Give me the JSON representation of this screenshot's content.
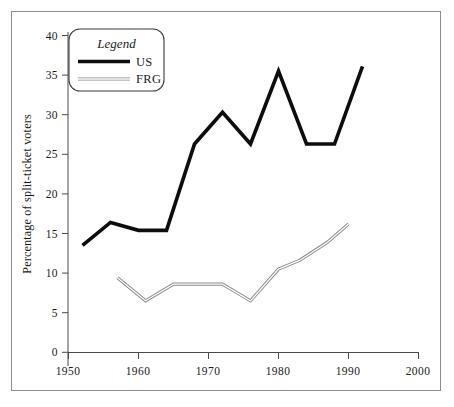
{
  "chart_data": {
    "type": "line",
    "title": "",
    "xlabel": "",
    "ylabel": "Percentage of split-ticket voters",
    "xlim": [
      1950,
      2000
    ],
    "ylim": [
      0,
      40
    ],
    "x_ticks": [
      "1950",
      "1960",
      "1970",
      "1980",
      "1990",
      "2000"
    ],
    "x_tick_values": [
      1950,
      1960,
      1970,
      1980,
      1990,
      2000
    ],
    "y_ticks": [
      "0",
      "5",
      "10",
      "15",
      "20",
      "25",
      "30",
      "35",
      "40"
    ],
    "y_tick_values": [
      0,
      5,
      10,
      15,
      20,
      25,
      30,
      35,
      40
    ],
    "grid": false,
    "legend_position": "upper-left",
    "legend_title": "Legend",
    "series": [
      {
        "name": "US",
        "color": "#0d0d0d",
        "style": "thick-solid",
        "x": [
          1952,
          1956,
          1960,
          1964,
          1968,
          1972,
          1976,
          1980,
          1984,
          1988,
          1992
        ],
        "values": [
          13.5,
          16.4,
          15.4,
          15.4,
          26.3,
          30.3,
          26.3,
          35.5,
          26.3,
          26.3,
          36.1
        ]
      },
      {
        "name": "FRG",
        "color": "#8a8a8a",
        "style": "thin-double",
        "x": [
          1957,
          1961,
          1965,
          1969,
          1972,
          1976,
          1980,
          1983,
          1987,
          1990
        ],
        "values": [
          9.4,
          6.5,
          8.6,
          8.6,
          8.6,
          6.5,
          10.5,
          11.6,
          13.9,
          16.2
        ]
      }
    ]
  },
  "legend": {
    "title": "Legend",
    "entries": [
      {
        "label": "US"
      },
      {
        "label": "FRG"
      }
    ]
  },
  "axes": {
    "y_title": "Percentage of split-ticket voters",
    "y_labels": [
      "40",
      "35",
      "30",
      "25",
      "20",
      "15",
      "10",
      "5",
      "0"
    ],
    "x_labels": [
      "1950",
      "1960",
      "1970",
      "1980",
      "1990",
      "2000"
    ]
  }
}
